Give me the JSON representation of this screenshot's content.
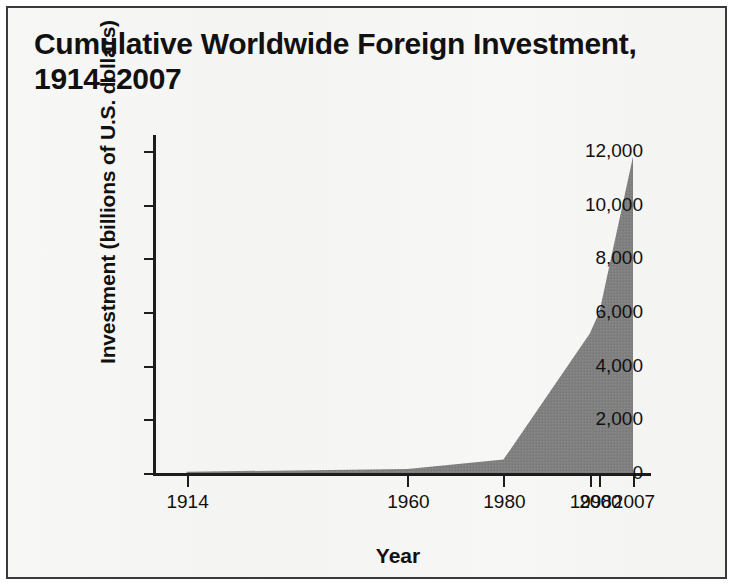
{
  "figure": {
    "title": "Cumulative Worldwide Foreign Investment,\n1914–2007",
    "border_color": "#3a3a3a",
    "page_background": "#f6f6f4"
  },
  "chart_data": {
    "type": "area",
    "title": "Cumulative Worldwide Foreign Investment, 1914–2007",
    "xlabel": "Year",
    "ylabel": "Investment (billions of U.S. dollars)",
    "x": [
      1914,
      1960,
      1980,
      1998,
      2000,
      2007
    ],
    "values": [
      50,
      150,
      500,
      5200,
      6000,
      11800
    ],
    "categories": [
      "1914",
      "1960",
      "1980",
      "1998",
      "2000",
      "2007"
    ],
    "xtick_labels": [
      "1914",
      "1960",
      "1980",
      "1998",
      "2000",
      "2007"
    ],
    "ytick_labels": [
      "0",
      "2,000",
      "4,000",
      "6,000",
      "8,000",
      "10,000",
      "12,000"
    ],
    "ytick_values": [
      0,
      2000,
      4000,
      6000,
      8000,
      10000,
      12000
    ],
    "xlim": [
      1907,
      2012
    ],
    "ylim": [
      0,
      12600
    ],
    "grid": false,
    "legend": false,
    "series": [
      {
        "name": "Cumulative worldwide foreign investment",
        "values": [
          50,
          150,
          500,
          5200,
          6000,
          11800
        ]
      }
    ],
    "area_fill_color": "#808080",
    "axis_color": "#1d1d1d"
  }
}
